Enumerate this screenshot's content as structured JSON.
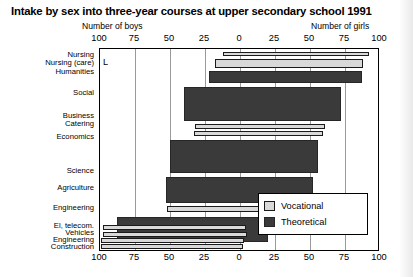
{
  "title": "Intake by sex into three-year courses at upper secondary school 1991",
  "captions": {
    "left": "Number of boys",
    "right": "Number of girls"
  },
  "marker": "L",
  "legend": {
    "items": [
      {
        "label": "Vocational",
        "color": "#d9d9d9",
        "key": "vocational"
      },
      {
        "label": "Theoretical",
        "color": "#3a3a3a",
        "key": "theoretical"
      }
    ]
  },
  "axis": {
    "tick_labels": [
      "100",
      "75",
      "50",
      "25",
      "0",
      "25",
      "50",
      "75",
      "100"
    ],
    "tick_values": [
      -100,
      -75,
      -50,
      -25,
      0,
      25,
      50,
      75,
      100
    ]
  },
  "chart_data": {
    "type": "bar",
    "orientation": "horizontal",
    "title": "Intake by sex into three-year courses at upper secondary school 1991",
    "subtitle": "",
    "xlabel": "Number of boys (left) / Number of girls (right)",
    "ylabel": "",
    "xlim": [
      -100,
      100
    ],
    "xticks": [
      -100,
      -75,
      -50,
      -25,
      0,
      25,
      50,
      75,
      100
    ],
    "xticklabels": [
      "100",
      "75",
      "50",
      "25",
      "0",
      "25",
      "50",
      "75",
      "100"
    ],
    "grid": true,
    "legend_position": "bottom-right",
    "note": "Each bar spans from the boys value (left of 0, plotted negative) to the girls value (right of 0). Bar thickness reflects the course intake size.",
    "categories": [
      "Nursing",
      "Nursing (care)",
      "Humanities",
      "Social",
      "Business",
      "Catering",
      "Economics",
      "Science",
      "Agriculture",
      "Engineering",
      "El, telecom.",
      "Vehicles",
      "Engineering",
      "Construction"
    ],
    "bars": [
      {
        "category": "Nursing",
        "type": "vocational",
        "boys": 12,
        "girls": 92,
        "thickness": "thin"
      },
      {
        "category": "Nursing (care)",
        "type": "vocational",
        "boys": 18,
        "girls": 88,
        "thickness": "thick"
      },
      {
        "category": "Humanities",
        "type": "theoretical",
        "boys": 22,
        "girls": 87,
        "thickness": "medium"
      },
      {
        "category": "Social",
        "type": "theoretical",
        "boys": 40,
        "girls": 72,
        "thickness": "thick"
      },
      {
        "category": "Business",
        "type": "vocational",
        "boys": 32,
        "girls": 61,
        "thickness": "thin"
      },
      {
        "category": "Catering",
        "type": "vocational",
        "boys": 33,
        "girls": 59,
        "thickness": "thin"
      },
      {
        "category": "Economics",
        "type": "theoretical",
        "boys": 50,
        "girls": 56,
        "thickness": "thick"
      },
      {
        "category": "Science",
        "type": "theoretical",
        "boys": 53,
        "girls": 52,
        "thickness": "medium"
      },
      {
        "category": "Agriculture",
        "type": "vocational",
        "boys": 52,
        "girls": 50,
        "thickness": "thin"
      },
      {
        "category": "Engineering",
        "type": "theoretical",
        "boys": 88,
        "girls": 20,
        "thickness": "thick"
      },
      {
        "category": "El, telecom.",
        "type": "vocational",
        "boys": 98,
        "girls": 4,
        "thickness": "thin"
      },
      {
        "category": "Vehicles",
        "type": "vocational",
        "boys": 98,
        "girls": 5,
        "thickness": "thin"
      },
      {
        "category": "Engineering",
        "type": "vocational",
        "boys": 99,
        "girls": 3,
        "thickness": "thin"
      },
      {
        "category": "Construction",
        "type": "vocational",
        "boys": 99,
        "girls": 2,
        "thickness": "thin"
      }
    ]
  },
  "layout": {
    "bar_rows": [
      {
        "key": "nursing",
        "label": "Nursing",
        "label_top": 3,
        "bar_top": 3,
        "bar_height": 4,
        "type": "vocational",
        "from": -12,
        "to": 92
      },
      {
        "key": "nursing-care",
        "label": "Nursing (care)",
        "label_top": 11,
        "bar_top": 10,
        "bar_height": 9,
        "type": "vocational",
        "from": -18,
        "to": 88
      },
      {
        "key": "humanities",
        "label": "Humanities",
        "label_top": 20,
        "bar_top": 22,
        "bar_height": 12,
        "type": "theoretical",
        "from": -22,
        "to": 87
      },
      {
        "key": "social",
        "label": "Social",
        "label_top": 41,
        "bar_top": 38,
        "bar_height": 34,
        "type": "theoretical",
        "from": -40,
        "to": 72
      },
      {
        "key": "business",
        "label": "Business",
        "label_top": 64,
        "bar_top": 75,
        "bar_height": 5,
        "type": "vocational",
        "from": -32,
        "to": 61
      },
      {
        "key": "catering",
        "label": "Catering",
        "label_top": 72,
        "bar_top": 82,
        "bar_height": 5,
        "type": "vocational",
        "from": -33,
        "to": 59
      },
      {
        "key": "economics",
        "label": "Economics",
        "label_top": 85,
        "bar_top": 91,
        "bar_height": 33,
        "type": "theoretical",
        "from": -50,
        "to": 56
      },
      {
        "key": "science",
        "label": "Science",
        "label_top": 119,
        "bar_top": 128,
        "bar_height": 26,
        "type": "theoretical",
        "from": -53,
        "to": 52
      },
      {
        "key": "agriculture",
        "label": "Agriculture",
        "label_top": 136,
        "bar_top": 157,
        "bar_height": 6,
        "type": "vocational",
        "from": -52,
        "to": 50
      },
      {
        "key": "engineering",
        "label": "Engineering",
        "label_top": 156,
        "bar_top": 168,
        "bar_height": 25,
        "type": "theoretical",
        "from": -88,
        "to": 20
      },
      {
        "key": "el-telecom",
        "label": "El, telecom.",
        "label_top": 174,
        "bar_top": 176,
        "bar_height": 5,
        "type": "vocational",
        "from": -98,
        "to": 4
      },
      {
        "key": "vehicles",
        "label": "Vehicles",
        "label_top": 181,
        "bar_top": 183,
        "bar_height": 5,
        "type": "vocational",
        "from": -98,
        "to": 5
      },
      {
        "key": "engineering-voc",
        "label": "Engineering",
        "label_top": 188,
        "bar_top": 189,
        "bar_height": 5,
        "type": "vocational",
        "from": -99,
        "to": 3
      },
      {
        "key": "construction",
        "label": "Construction",
        "label_top": 195,
        "bar_top": 195,
        "bar_height": 5,
        "type": "vocational",
        "from": -99,
        "to": 2
      }
    ]
  }
}
